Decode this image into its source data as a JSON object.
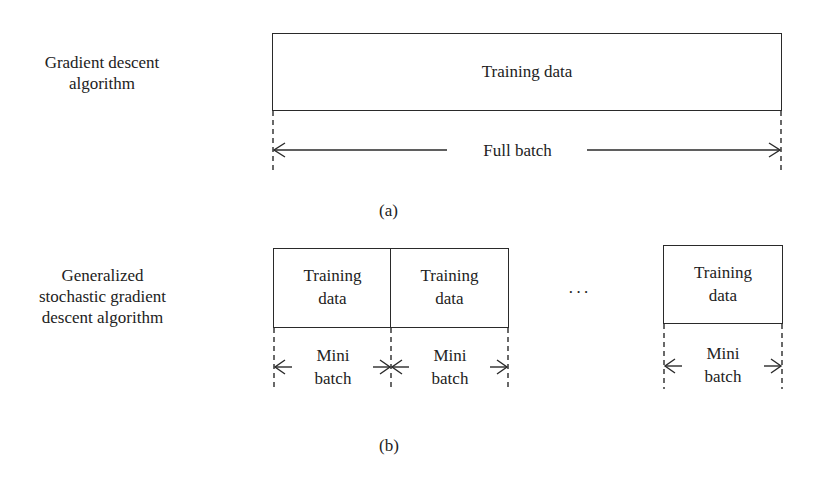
{
  "panel_a": {
    "caption": "(a)",
    "method_label_line1": "Gradient descent",
    "method_label_line2": "algorithm",
    "box_label": "Training data",
    "span_label": "Full batch"
  },
  "panel_b": {
    "caption": "(b)",
    "method_label_line1": "Generalized",
    "method_label_line2": "stochastic gradient",
    "method_label_line3": "descent algorithm",
    "boxes": [
      {
        "line1": "Training",
        "line2": "data",
        "span_line1": "Mini",
        "span_line2": "batch"
      },
      {
        "line1": "Training",
        "line2": "data",
        "span_line1": "Mini",
        "span_line2": "batch"
      },
      {
        "line1": "Training",
        "line2": "data",
        "span_line1": "Mini",
        "span_line2": "batch"
      }
    ],
    "ellipsis": "···"
  },
  "colors": {
    "stroke": "#2a2a2a",
    "text": "#222222",
    "background": "#ffffff"
  }
}
